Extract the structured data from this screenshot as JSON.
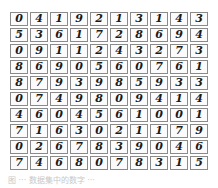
{
  "figure": {
    "rows": [
      [
        "0",
        "4",
        "1",
        "9",
        "2",
        "1",
        "3",
        "1",
        "4",
        "3"
      ],
      [
        "5",
        "3",
        "6",
        "1",
        "7",
        "2",
        "8",
        "6",
        "9",
        "4"
      ],
      [
        "0",
        "9",
        "1",
        "1",
        "2",
        "4",
        "3",
        "2",
        "7",
        "3"
      ],
      [
        "8",
        "6",
        "9",
        "0",
        "5",
        "6",
        "0",
        "7",
        "6",
        "1"
      ],
      [
        "8",
        "7",
        "9",
        "3",
        "9",
        "8",
        "5",
        "9",
        "3",
        "3"
      ],
      [
        "0",
        "7",
        "4",
        "9",
        "8",
        "0",
        "9",
        "4",
        "1",
        "4"
      ],
      [
        "4",
        "6",
        "0",
        "4",
        "5",
        "6",
        "1",
        "0",
        "0",
        "1"
      ],
      [
        "7",
        "1",
        "6",
        "3",
        "0",
        "2",
        "1",
        "1",
        "7",
        "9"
      ],
      [
        "0",
        "2",
        "6",
        "7",
        "8",
        "3",
        "9",
        "0",
        "4",
        "6"
      ],
      [
        "7",
        "4",
        "6",
        "8",
        "0",
        "7",
        "8",
        "3",
        "1",
        "5"
      ]
    ],
    "caption": "图 ··· 数据集中的数字 ···"
  }
}
